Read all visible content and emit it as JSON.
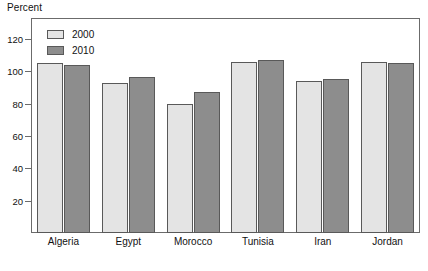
{
  "chart_data": {
    "type": "bar",
    "title": "",
    "xlabel": "",
    "ylabel": "Percent",
    "ylim": [
      0,
      133
    ],
    "yticks": [
      20,
      40,
      60,
      80,
      100,
      120
    ],
    "grid": false,
    "legend_position": "top-left",
    "categories": [
      "Algeria",
      "Egypt",
      "Morocco",
      "Tunisia",
      "Iran",
      "Jordan"
    ],
    "series": [
      {
        "name": "2000",
        "color": "#e4e4e4",
        "values": [
          105,
          93,
          80,
          105.5,
          94,
          105.5
        ]
      },
      {
        "name": "2010",
        "color": "#8d8d8d",
        "values": [
          104,
          96.5,
          87,
          107,
          95.5,
          105
        ]
      }
    ]
  },
  "axis": {
    "y_title": "Percent",
    "tick_labels": [
      "120",
      "100",
      "80",
      "60",
      "40",
      "20"
    ]
  },
  "legend": {
    "items": [
      {
        "label": "2000"
      },
      {
        "label": "2010"
      }
    ]
  },
  "colors": {
    "series_2000": "#e4e4e4",
    "series_2010": "#8d8d8d",
    "frame": "#6b6b6b",
    "bar_outline": "#595959",
    "text": "#111111",
    "background": "#ffffff"
  }
}
